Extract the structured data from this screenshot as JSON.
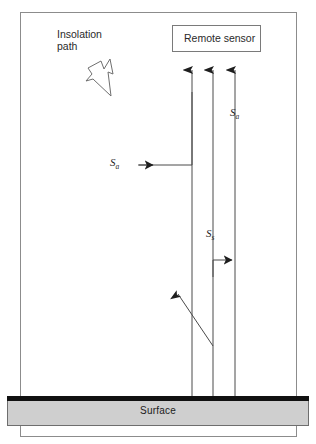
{
  "figure": {
    "type": "schematic-diagram",
    "background": "#ffffff"
  },
  "frame": {
    "name": "diagram-frame",
    "x": 20,
    "y": 12,
    "width": 277,
    "height": 425,
    "stroke": "#8c8c8c",
    "fill": "#ffffff"
  },
  "labels": {
    "insolation_path": "Insolation\npath",
    "insolation_path_line1": "Insolation",
    "insolation_path_line2": "path",
    "remote_sensor": "Remote sensor",
    "surface": "Surface"
  },
  "symbols": [
    {
      "id": "sa-top",
      "base": "S",
      "sub": "a",
      "text": "Sa",
      "x": 230,
      "y": 106,
      "meaning": "atmospheric path radiance (upper)"
    },
    {
      "id": "sa-mid",
      "base": "S",
      "sub": "a",
      "text": "Sa",
      "x": 110,
      "y": 156,
      "meaning": "atmospheric path radiance (scattered into view)"
    },
    {
      "id": "ss",
      "base": "S",
      "sub": "s",
      "text": "Ss",
      "x": 206,
      "y": 227,
      "meaning": "surface reflected radiance"
    }
  ],
  "sensor_box": {
    "name": "remote-sensor-box",
    "x": 172,
    "y": 25,
    "width": 89,
    "height": 27,
    "stroke": "#7a7a7a",
    "fill": "#ffffff"
  },
  "surface_bar": {
    "name": "surface-bar",
    "x": 7,
    "y": 396,
    "width": 302,
    "height": 30,
    "cap_color": "#111111",
    "cap_height": 4,
    "body_color": "#cfcfcf",
    "body_stroke": "#6e6e6e"
  },
  "insolation_polygon": {
    "name": "insolation-path-glyph",
    "stroke": "#6f6f6f",
    "fill": "#ffffff",
    "points": "88,68 101,61 104,69 110,59 113,74 108,72 111,96 93,79 86,81 92,74"
  },
  "rays": [
    {
      "id": "ray-left",
      "name": "ray-to-sensor-left",
      "x": 192,
      "y_top": 70,
      "y_bottom": 396,
      "arrow": "up",
      "kind": "vertical"
    },
    {
      "id": "ray-middle",
      "name": "ray-to-sensor-middle",
      "x": 213,
      "y_top": 70,
      "y_bottom": 396,
      "arrow": "up",
      "kind": "vertical"
    },
    {
      "id": "ray-right",
      "name": "ray-to-sensor-right",
      "x": 235,
      "y_top": 70,
      "y_bottom": 396,
      "arrow": "up",
      "kind": "vertical"
    },
    {
      "id": "ray-sa-elbow",
      "name": "ray-atmospheric-path-elbow",
      "kind": "elbow",
      "path": "M 139,165 L 192,165 L 192,80",
      "arrow": "right-at-start-segment",
      "arrow_x": 152,
      "arrow_y": 165
    },
    {
      "id": "ray-ss-step",
      "name": "ray-surface-scatter-step",
      "kind": "elbow",
      "path": "M 213,275 L 213,260 L 240,260",
      "arrow": "right",
      "arrow_x": 236,
      "arrow_y": 260
    },
    {
      "id": "ray-diagonal",
      "name": "ray-scattered-out",
      "kind": "diagonal",
      "x1": 212,
      "y1": 345,
      "x2": 178,
      "y2": 295,
      "arrow": "up-left"
    }
  ],
  "colors": {
    "line": "#4a4a4a",
    "frame": "#8c8c8c",
    "surface_gray": "#cfcfcf",
    "surface_cap": "#111111",
    "text": "#1a1a1a"
  }
}
